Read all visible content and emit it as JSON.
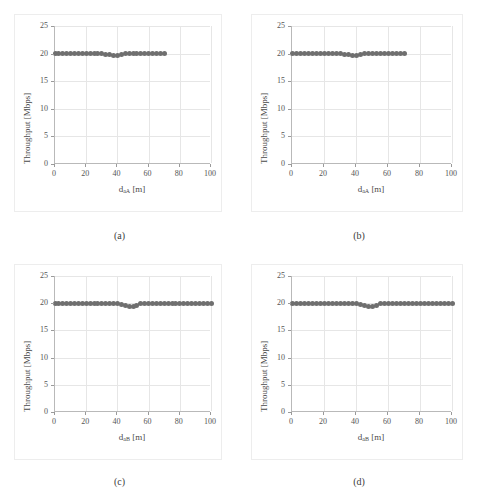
{
  "figure": {
    "axis": {
      "ylabel": "Throughput [Mbps]",
      "yticks": [
        "0",
        "5",
        "10",
        "15",
        "20",
        "25"
      ],
      "xticks": [
        "0",
        "20",
        "40",
        "60",
        "80",
        "100"
      ],
      "xlim": [
        0,
        100
      ],
      "ylim": [
        0,
        25
      ],
      "marker_color": "#6f6f6f",
      "grid_color": "#e6e6e6"
    },
    "panels": [
      {
        "caption": "(a)",
        "xlabel_base": "d",
        "xlabel_sub": "aA",
        "xlabel_unit": "[m]"
      },
      {
        "caption": "(b)",
        "xlabel_base": "d",
        "xlabel_sub": "aA",
        "xlabel_unit": "[m]"
      },
      {
        "caption": "(c)",
        "xlabel_base": "d",
        "xlabel_sub": "aB",
        "xlabel_unit": "[m]"
      },
      {
        "caption": "(d)",
        "xlabel_base": "d",
        "xlabel_sub": "aB",
        "xlabel_unit": "[m]"
      }
    ]
  },
  "chart_data": [
    {
      "type": "scatter",
      "panel": "(a)",
      "title": "",
      "xlabel": "d_aA [m]",
      "ylabel": "Throughput [Mbps]",
      "xlim": [
        0,
        100
      ],
      "ylim": [
        0,
        25
      ],
      "xticks": [
        0,
        20,
        40,
        60,
        80,
        100
      ],
      "yticks": [
        0,
        5,
        10,
        15,
        20,
        25
      ],
      "grid": true,
      "legend": null,
      "x": [
        0,
        2.5,
        5,
        7.5,
        10,
        12.5,
        15,
        17.5,
        20,
        22.5,
        25,
        27.5,
        30,
        32.5,
        35,
        37.5,
        40,
        42.5,
        45,
        47.5,
        50,
        52.5,
        55,
        57.5,
        60,
        62.5,
        65,
        67.5,
        70
      ],
      "y": [
        20.0,
        20.0,
        20.0,
        20.0,
        20.0,
        20.0,
        20.0,
        20.0,
        20.0,
        20.0,
        20.0,
        20.0,
        20.0,
        19.9,
        19.8,
        19.7,
        19.6,
        19.8,
        20.0,
        20.0,
        20.0,
        20.0,
        20.0,
        20.0,
        20.0,
        20.0,
        20.0,
        20.0,
        20.0
      ]
    },
    {
      "type": "scatter",
      "panel": "(b)",
      "title": "",
      "xlabel": "d_aA [m]",
      "ylabel": "Throughput [Mbps]",
      "xlim": [
        0,
        100
      ],
      "ylim": [
        0,
        25
      ],
      "xticks": [
        0,
        20,
        40,
        60,
        80,
        100
      ],
      "yticks": [
        0,
        5,
        10,
        15,
        20,
        25
      ],
      "grid": true,
      "legend": null,
      "x": [
        0,
        2.5,
        5,
        7.5,
        10,
        12.5,
        15,
        17.5,
        20,
        22.5,
        25,
        27.5,
        30,
        32.5,
        35,
        37.5,
        40,
        42.5,
        45,
        47.5,
        50,
        52.5,
        55,
        57.5,
        60,
        62.5,
        65,
        67.5,
        70
      ],
      "y": [
        20.0,
        20.0,
        20.0,
        20.0,
        20.0,
        20.0,
        20.0,
        20.0,
        20.0,
        20.0,
        20.0,
        20.0,
        20.0,
        19.9,
        19.8,
        19.7,
        19.6,
        19.8,
        20.0,
        20.0,
        20.0,
        20.0,
        20.0,
        20.0,
        20.0,
        20.0,
        20.0,
        20.0,
        20.0
      ]
    },
    {
      "type": "scatter",
      "panel": "(c)",
      "title": "",
      "xlabel": "d_aB [m]",
      "ylabel": "Throughput [Mbps]",
      "xlim": [
        0,
        100
      ],
      "ylim": [
        0,
        25
      ],
      "xticks": [
        0,
        20,
        40,
        60,
        80,
        100
      ],
      "yticks": [
        0,
        5,
        10,
        15,
        20,
        25
      ],
      "grid": true,
      "legend": null,
      "x": [
        0,
        2.5,
        5,
        7.5,
        10,
        12.5,
        15,
        17.5,
        20,
        22.5,
        25,
        27.5,
        30,
        32.5,
        35,
        37.5,
        40,
        42.5,
        45,
        47.5,
        50,
        52.5,
        55,
        57.5,
        60,
        62.5,
        65,
        67.5,
        70,
        72.5,
        75,
        77.5,
        80,
        82.5,
        85,
        87.5,
        90,
        92.5,
        95,
        97.5,
        100
      ],
      "y": [
        20.0,
        20.0,
        20.0,
        20.0,
        20.0,
        20.0,
        20.0,
        20.0,
        20.0,
        20.0,
        20.0,
        20.0,
        20.0,
        20.0,
        20.0,
        20.0,
        19.9,
        19.7,
        19.5,
        19.4,
        19.4,
        19.6,
        19.9,
        20.0,
        20.0,
        20.0,
        20.0,
        20.0,
        20.0,
        20.0,
        20.0,
        20.0,
        20.0,
        20.0,
        20.0,
        20.0,
        20.0,
        20.0,
        20.0,
        20.0,
        20.0
      ]
    },
    {
      "type": "scatter",
      "panel": "(d)",
      "title": "",
      "xlabel": "d_aB [m]",
      "ylabel": "Throughput [Mbps]",
      "xlim": [
        0,
        100
      ],
      "ylim": [
        0,
        25
      ],
      "xticks": [
        0,
        20,
        40,
        60,
        80,
        100
      ],
      "yticks": [
        0,
        5,
        10,
        15,
        20,
        25
      ],
      "grid": true,
      "legend": null,
      "x": [
        0,
        2.5,
        5,
        7.5,
        10,
        12.5,
        15,
        17.5,
        20,
        22.5,
        25,
        27.5,
        30,
        32.5,
        35,
        37.5,
        40,
        42.5,
        45,
        47.5,
        50,
        52.5,
        55,
        57.5,
        60,
        62.5,
        65,
        67.5,
        70,
        72.5,
        75,
        77.5,
        80,
        82.5,
        85,
        87.5,
        90,
        92.5,
        95,
        97.5,
        100
      ],
      "y": [
        20.0,
        20.0,
        20.0,
        20.0,
        20.0,
        20.0,
        20.0,
        20.0,
        20.0,
        20.0,
        20.0,
        20.0,
        20.0,
        20.0,
        20.0,
        20.0,
        19.9,
        19.7,
        19.5,
        19.4,
        19.4,
        19.6,
        19.9,
        20.0,
        20.0,
        20.0,
        20.0,
        20.0,
        20.0,
        20.0,
        20.0,
        20.0,
        20.0,
        20.0,
        20.0,
        20.0,
        20.0,
        20.0,
        20.0,
        20.0,
        20.0
      ]
    }
  ]
}
